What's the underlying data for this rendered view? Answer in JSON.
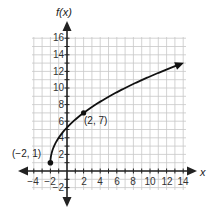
{
  "chart_data": {
    "type": "line",
    "title": "",
    "xlabel": "x",
    "ylabel": "f(x)",
    "xlim": [
      -4,
      14
    ],
    "ylim": [
      -2,
      16
    ],
    "grid": true,
    "x_ticks": [
      "-4",
      "-2",
      "2",
      "4",
      "6",
      "8",
      "10",
      "12",
      "14"
    ],
    "y_ticks": [
      "-2",
      "2",
      "4",
      "6",
      "8",
      "10",
      "12",
      "14",
      "16"
    ],
    "series": [
      {
        "name": "f(x)",
        "x": [
          -2,
          -1.5,
          -1,
          0,
          1,
          2,
          4,
          6,
          8,
          10,
          12,
          14
        ],
        "values": [
          1,
          3.12,
          4,
          5.24,
          6.2,
          7,
          8.35,
          9.49,
          10.49,
          11.39,
          12.22,
          13
        ],
        "start_point_closed": true,
        "end_arrow": true
      }
    ],
    "annotations": [
      {
        "text": "(−2, 1)",
        "x": -2,
        "y": 1
      },
      {
        "text": "(2, 7)",
        "x": 2,
        "y": 7
      }
    ]
  },
  "labels": {
    "y_axis": "f(x)",
    "x_axis": "x",
    "point_a": "(−2, 1)",
    "point_b": "(2, 7)",
    "xt": [
      "−4",
      "−2",
      "2",
      "4",
      "6",
      "8",
      "10",
      "12",
      "14"
    ],
    "yt": [
      "−2",
      "2",
      "4",
      "6",
      "8",
      "10",
      "12",
      "14",
      "16"
    ]
  }
}
